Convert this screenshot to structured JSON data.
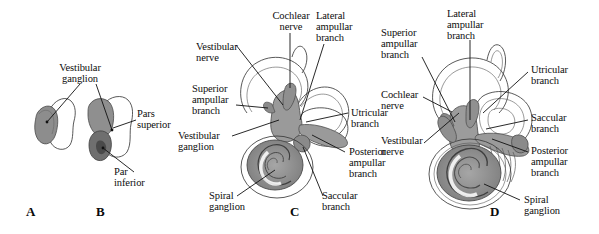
{
  "figure": {
    "background_color": "#ffffff",
    "ink_color": "#111111",
    "shading": {
      "nerve_gray": "#9b9b9b",
      "nerve_gray_dark": "#6f6f6f",
      "ganglion_gray": "#828282",
      "cochlea_gray": "#8d8d8d",
      "canal_fill": "#ffffff",
      "outline": "#3b3b3b"
    }
  },
  "panels": [
    {
      "letter": "A",
      "name": "panel-a",
      "caption": "Vestibular ganglion, simple form",
      "labels": [
        {
          "name": "label-vestibular-ganglion-a",
          "text": "Vestibular\nganglion"
        }
      ]
    },
    {
      "letter": "B",
      "name": "panel-b",
      "caption": "Vestibular ganglion with pars superior and par inferior",
      "labels": [
        {
          "name": "label-pars-superior",
          "text": "Pars\nsuperior"
        },
        {
          "name": "label-par-inferior",
          "text": "Par\ninferior"
        }
      ]
    },
    {
      "letter": "C",
      "name": "panel-c",
      "caption": "Vestibulocochlear nerve branches with labyrinth",
      "labels": [
        {
          "name": "label-cochlear-nerve-c",
          "text": "Cochlear\nnerve"
        },
        {
          "name": "label-lateral-ampullar-branch-c",
          "text": "Lateral\nampullar\nbranch"
        },
        {
          "name": "label-vestibular-nerve-c",
          "text": "Vestibular\nnerve"
        },
        {
          "name": "label-superior-ampullar-branch-c",
          "text": "Superior\nampullar\nbranch"
        },
        {
          "name": "label-vestibular-ganglion-c",
          "text": "Vestibular\nganglion"
        },
        {
          "name": "label-utricular-branch-c",
          "text": "Utricular\nbranch"
        },
        {
          "name": "label-posterior-ampullar-branch-c",
          "text": "Posterior\nampullar\nbranch"
        },
        {
          "name": "label-spiral-ganglion-c",
          "text": "Spiral\nganglion"
        },
        {
          "name": "label-saccular-branch-c",
          "text": "Saccular\nbranch"
        }
      ]
    },
    {
      "letter": "D",
      "name": "panel-d",
      "caption": "Vestibulocochlear nerve branches, alternate view",
      "labels": [
        {
          "name": "label-lateral-ampullar-branch-d",
          "text": "Lateral\nampullar\nbranch"
        },
        {
          "name": "label-superior-ampullar-branch-d",
          "text": "Superior\nampullar\nbranch"
        },
        {
          "name": "label-utricular-branch-d",
          "text": "Utricular\nbranch"
        },
        {
          "name": "label-cochlear-nerve-d",
          "text": "Cochlear\nnerve"
        },
        {
          "name": "label-saccular-branch-d",
          "text": "Saccular\nbranch"
        },
        {
          "name": "label-vestibular-nerve-d",
          "text": "Vestibular\nnerve"
        },
        {
          "name": "label-posterior-ampullar-branch-d",
          "text": "Posterior\nampullar\nbranch"
        },
        {
          "name": "label-spiral-ganglion-d",
          "text": "Spiral\nganglion"
        }
      ]
    }
  ],
  "panel_a": {
    "letter": "A",
    "vestibular_ganglion": "Vestibular\nganglion"
  },
  "panel_b": {
    "letter": "B",
    "pars_superior": "Pars\nsuperior",
    "par_inferior": "Par\ninferior"
  },
  "panel_c": {
    "letter": "C",
    "cochlear_nerve": "Cochlear\nnerve",
    "lateral_ampullar_branch": "Lateral\nampullar\nbranch",
    "vestibular_nerve": "Vestibular\nnerve",
    "superior_ampullar_branch": "Superior\nampullar\nbranch",
    "vestibular_ganglion": "Vestibular\nganglion",
    "utricular_branch": "Utricular\nbranch",
    "posterior_ampullar_branch": "Posterior\nampullar\nbranch",
    "spiral_ganglion": "Spiral\nganglion",
    "saccular_branch": "Saccular\nbranch"
  },
  "panel_d": {
    "letter": "D",
    "lateral_ampullar_branch": "Lateral\nampullar\nbranch",
    "superior_ampullar_branch": "Superior\nampullar\nbranch",
    "utricular_branch": "Utricular\nbranch",
    "cochlear_nerve": "Cochlear\nnerve",
    "saccular_branch": "Saccular\nbranch",
    "vestibular_nerve": "Vestibular\nnerve",
    "posterior_ampullar_branch": "Posterior\nampullar\nbranch",
    "spiral_ganglion": "Spiral\nganglion"
  }
}
